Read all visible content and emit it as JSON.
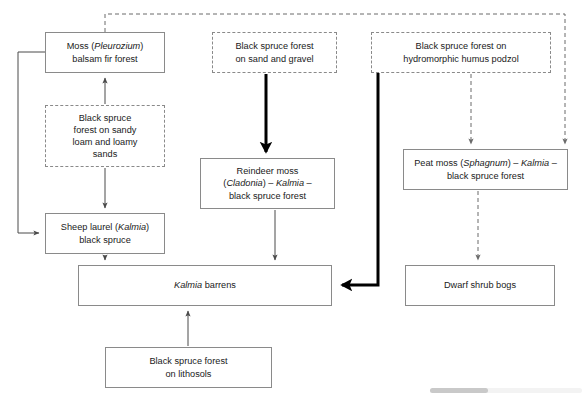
{
  "diagram": {
    "colors": {
      "box_border_solid": "#8a8a8a",
      "box_border_dashed": "#8a8a8a",
      "arrow_thin": "#4a4a4a",
      "arrow_thick": "#000000",
      "text": "#1a1a1a",
      "background": "#ffffff",
      "scrollbar_track": "#f3f3f3",
      "scrollbar_thumb": "#c9c9c9"
    },
    "nodes": [
      {
        "id": "moss-balsam-fir",
        "name": "moss-pleurozium-balsam-fir-forest-box",
        "style": "solid",
        "lines": [
          "Moss (Pleurozium)",
          "balsam fir forest"
        ],
        "text": "Moss (Pleurozium)\nbalsam fir forest",
        "x": 45,
        "y": 32,
        "w": 120,
        "h": 41
      },
      {
        "id": "bs-sandy-loam",
        "name": "black-spruce-forest-sandy-loam-box",
        "style": "dashed",
        "lines": [
          "Black spruce",
          "forest on sandy",
          "loam and loamy",
          "sands"
        ],
        "text": "Black spruce\nforest on sandy\nloam and loamy\nsands",
        "x": 45,
        "y": 105,
        "w": 120,
        "h": 62
      },
      {
        "id": "sheep-laurel",
        "name": "sheep-laurel-kalmia-black-spruce-box",
        "style": "solid",
        "lines": [
          "Sheep laurel (Kalmia)",
          "black spruce"
        ],
        "text": "Sheep laurel (Kalmia)\nblack spruce",
        "x": 45,
        "y": 213,
        "w": 120,
        "h": 41
      },
      {
        "id": "bs-sand-gravel",
        "name": "black-spruce-forest-sand-and-gravel-box",
        "style": "dashed",
        "lines": [
          "Black spruce forest",
          "on sand and gravel"
        ],
        "text": "Black spruce forest\non sand and gravel",
        "x": 212,
        "y": 32,
        "w": 125,
        "h": 41
      },
      {
        "id": "reindeer-moss",
        "name": "reindeer-moss-cladonia-kalmia-black-spruce-box",
        "style": "solid",
        "lines": [
          "Reindeer moss",
          "(Cladonia) – Kalmia –",
          "black spruce forest"
        ],
        "text": "Reindeer moss\n(Cladonia) – Kalmia –\nblack spruce forest",
        "x": 200,
        "y": 158,
        "w": 135,
        "h": 51
      },
      {
        "id": "bs-hydromorphic",
        "name": "black-spruce-forest-hydromorphic-humus-podzol-box",
        "style": "dashed",
        "lines": [
          "Black spruce forest on",
          "hydromorphic humus podzol"
        ],
        "text": "Black spruce forest on\nhydromorphic humus podzol",
        "x": 371,
        "y": 32,
        "w": 180,
        "h": 41
      },
      {
        "id": "peat-moss",
        "name": "peat-moss-sphagnum-kalmia-black-spruce-box",
        "style": "solid",
        "lines": [
          "Peat moss (Sphagnum) – Kalmia –",
          "black spruce forest"
        ],
        "text": "Peat moss (Sphagnum) – Kalmia –\nblack spruce forest",
        "x": 403,
        "y": 149,
        "w": 165,
        "h": 41
      },
      {
        "id": "kalmia-barrens",
        "name": "kalmia-barrens-box",
        "style": "solid",
        "lines": [
          "Kalmia barrens"
        ],
        "text": "Kalmia barrens",
        "x": 78,
        "y": 265,
        "w": 254,
        "h": 41
      },
      {
        "id": "dwarf-shrub-bogs",
        "name": "dwarf-shrub-bogs-box",
        "style": "solid",
        "lines": [
          "Dwarf shrub bogs"
        ],
        "text": "Dwarf shrub bogs",
        "x": 405,
        "y": 265,
        "w": 150,
        "h": 41
      },
      {
        "id": "bs-lithosols",
        "name": "black-spruce-forest-on-lithosols-box",
        "style": "solid",
        "lines": [
          "Black spruce forest",
          "on lithosols"
        ],
        "text": "Black spruce forest\non lithosols",
        "x": 105,
        "y": 347,
        "w": 167,
        "h": 41
      }
    ],
    "edges": [
      {
        "id": "e1",
        "name": "arrow-sandy-loam-to-moss",
        "from": "bs-sandy-loam",
        "to": "moss-balsam-fir",
        "style": "thin-solid"
      },
      {
        "id": "e2",
        "name": "arrow-sandy-loam-to-sheep-laurel",
        "from": "bs-sandy-loam",
        "to": "sheep-laurel",
        "style": "thin-solid"
      },
      {
        "id": "e3",
        "name": "arrow-moss-loop-to-sheep-laurel",
        "from": "moss-balsam-fir",
        "to": "sheep-laurel",
        "style": "thin-solid-left-loop"
      },
      {
        "id": "e4",
        "name": "arrow-moss-dashed-feedback-to-peat-moss",
        "from": "moss-balsam-fir",
        "to": "peat-moss",
        "style": "dashed-top-loop"
      },
      {
        "id": "e5",
        "name": "arrow-sand-gravel-to-reindeer-moss",
        "from": "bs-sand-gravel",
        "to": "reindeer-moss",
        "style": "thick-solid"
      },
      {
        "id": "e6",
        "name": "arrow-reindeer-moss-to-kalmia-barrens",
        "from": "reindeer-moss",
        "to": "kalmia-barrens",
        "style": "thin-solid"
      },
      {
        "id": "e7",
        "name": "arrow-sheep-laurel-to-kalmia-barrens",
        "from": "sheep-laurel",
        "to": "kalmia-barrens",
        "style": "thin-solid"
      },
      {
        "id": "e8",
        "name": "arrow-hydromorphic-to-peat-moss",
        "from": "bs-hydromorphic",
        "to": "peat-moss",
        "style": "dashed"
      },
      {
        "id": "e9",
        "name": "arrow-hydromorphic-to-kalmia-barrens",
        "from": "bs-hydromorphic",
        "to": "kalmia-barrens",
        "style": "thick-solid-elbow"
      },
      {
        "id": "e10",
        "name": "arrow-peat-moss-to-dwarf-shrub-bogs",
        "from": "peat-moss",
        "to": "dwarf-shrub-bogs",
        "style": "dashed"
      },
      {
        "id": "e11",
        "name": "arrow-lithosols-to-kalmia-barrens",
        "from": "bs-lithosols",
        "to": "kalmia-barrens",
        "style": "thin-solid"
      }
    ]
  },
  "scrollbar": {
    "name": "horizontal-scrollbar",
    "position": "bottom-right"
  }
}
